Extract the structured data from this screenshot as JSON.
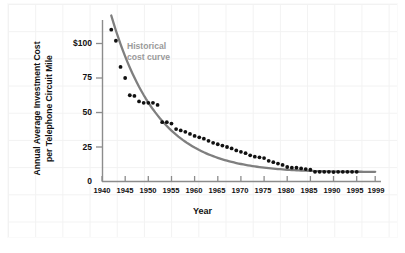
{
  "chart_data": {
    "type": "scatter",
    "title": "",
    "xlabel": "Year",
    "ylabel_line1": "Annual Average Investment Cost",
    "ylabel_line2": "per Telephone Circuit Mile",
    "xlim": [
      1940,
      1999
    ],
    "ylim": [
      0,
      115
    ],
    "grid": false,
    "legend": "none",
    "annotations": [
      {
        "name": "historical-cost-curve-label",
        "line1": "Historical",
        "line2": "cost curve",
        "color": "#9a9a9a"
      }
    ],
    "xticks": [
      1940,
      1945,
      1950,
      1955,
      1960,
      1965,
      1970,
      1975,
      1980,
      1985,
      1990,
      1995,
      1999
    ],
    "xtick_labels": [
      "1940",
      "1945",
      "1950",
      "1955",
      "1960",
      "1965",
      "1970",
      "1975",
      "1980",
      "1985",
      "1990",
      "1995",
      "1999"
    ],
    "yticks": [
      0,
      25,
      50,
      75,
      100
    ],
    "ytick_labels": [
      "0",
      "25",
      "50",
      "75",
      "$100"
    ],
    "series": [
      {
        "name": "Annual average investment cost per telephone circuit mile",
        "marker": "filled-circle",
        "color": "#111111",
        "x": [
          1942,
          1943,
          1944,
          1945,
          1946,
          1947,
          1948,
          1949,
          1950,
          1951,
          1952,
          1953,
          1954,
          1955,
          1956,
          1957,
          1958,
          1959,
          1960,
          1961,
          1962,
          1963,
          1964,
          1965,
          1966,
          1967,
          1968,
          1969,
          1970,
          1971,
          1972,
          1973,
          1974,
          1975,
          1976,
          1977,
          1978,
          1979,
          1980,
          1981,
          1982,
          1983,
          1984,
          1985,
          1986,
          1987,
          1988,
          1989,
          1990,
          1991,
          1992,
          1993,
          1994,
          1995
        ],
        "y": [
          110,
          102,
          83,
          75,
          62.5,
          62,
          58,
          57,
          57,
          57,
          55.5,
          43,
          43,
          42,
          38,
          37,
          36,
          34.5,
          33,
          32,
          31,
          29.5,
          28,
          27,
          26,
          25,
          24,
          22.5,
          21.5,
          20.5,
          19,
          18,
          17.5,
          17,
          15,
          14,
          13,
          12,
          10.5,
          10,
          10,
          9.5,
          9,
          8.5,
          7,
          7,
          7,
          7,
          6.8,
          7,
          7,
          7,
          7,
          7
        ]
      }
    ],
    "fit_curve": {
      "name": "historical-cost-curve",
      "color": "#7f7f7f",
      "style": "smooth-decaying",
      "x_start": 1942,
      "x_end": 1999,
      "y_start": 110,
      "y_end": 7
    }
  }
}
